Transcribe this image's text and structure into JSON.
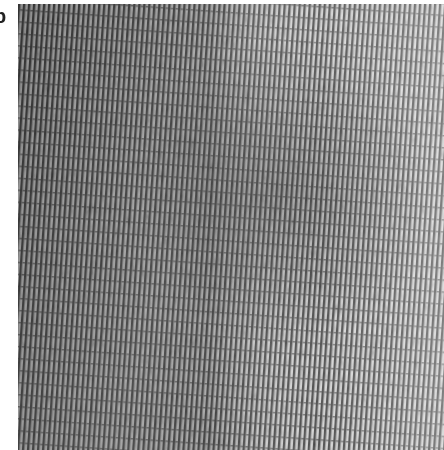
{
  "figure": {
    "panel_label": "b",
    "image": {
      "type": "grayscale lattice micrograph",
      "description": "High-resolution lattice fringe image with vertical striped periodic texture, slight diagonal tilt; darker on left and center, lighter toward the right.",
      "colors": {
        "dark": "#4a4a4a",
        "mid": "#8c8c8c",
        "light": "#e6e6e6"
      }
    }
  }
}
